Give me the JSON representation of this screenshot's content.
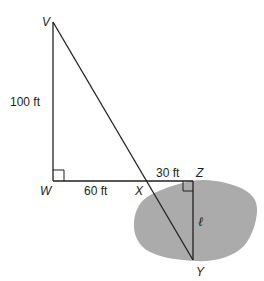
{
  "diagram": {
    "type": "geometry-figure",
    "points": {
      "V": {
        "label": "V",
        "x": 53,
        "y": 22
      },
      "W": {
        "label": "W",
        "x": 53,
        "y": 181
      },
      "X": {
        "label": "X",
        "x": 149,
        "y": 181
      },
      "Z": {
        "label": "Z",
        "x": 193,
        "y": 181
      },
      "Y": {
        "label": "Y",
        "x": 193,
        "y": 260
      }
    },
    "measurements": {
      "VW": "100 ft",
      "WX": "60 ft",
      "XZ": "30 ft",
      "ZY": "ℓ"
    },
    "right_angles": [
      "W",
      "Z"
    ],
    "region": {
      "name": "pond",
      "fill": "#ababab"
    },
    "colors": {
      "stroke": "#231f20",
      "region_fill": "#ababab"
    }
  }
}
